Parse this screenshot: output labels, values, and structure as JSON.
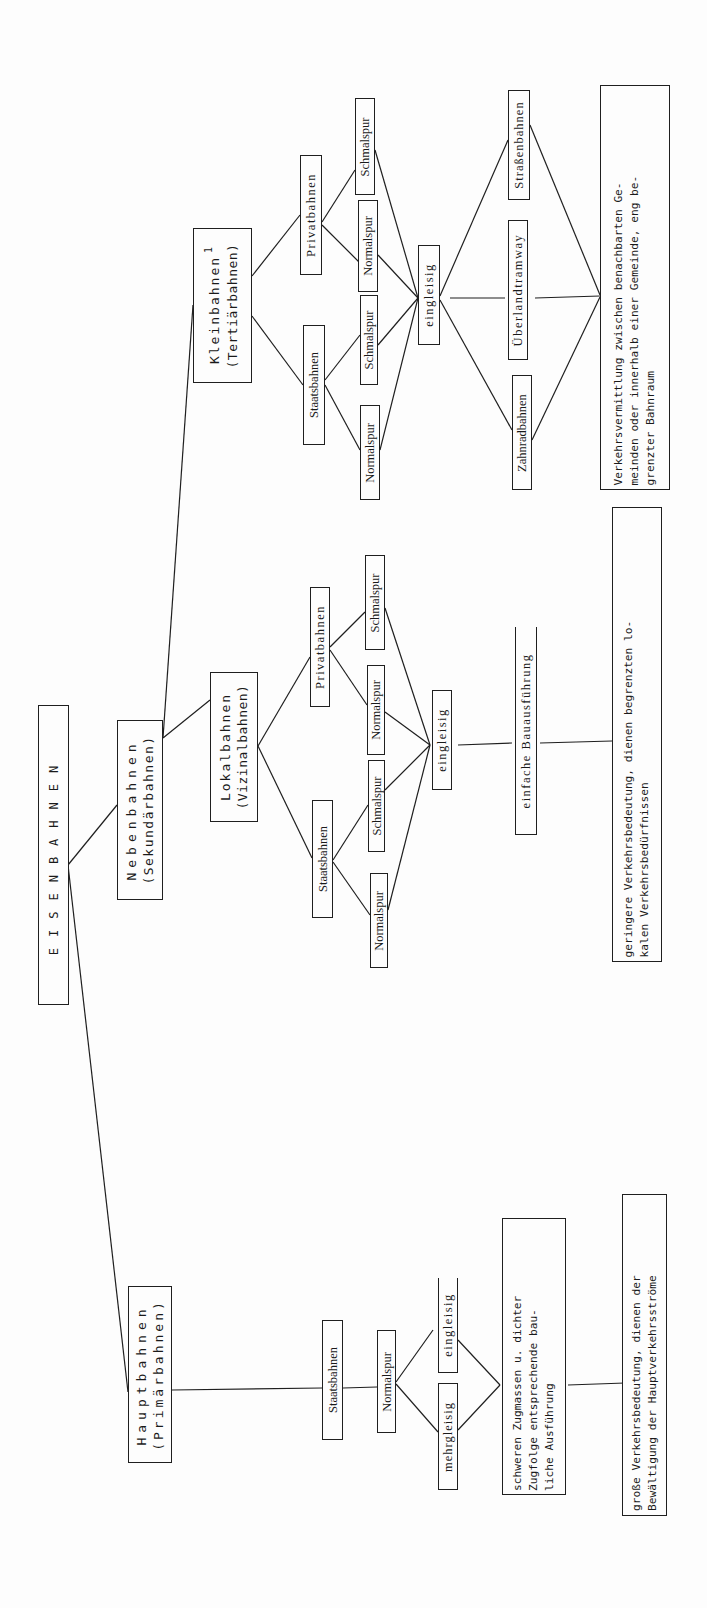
{
  "title": "EISENBAHNEN",
  "categories": {
    "haupt": {
      "name": "Hauptbahnen",
      "alt": "(Primärbahnen)"
    },
    "neben": {
      "name": "Nebenbahnen",
      "alt": "(Sekundärbahnen)"
    },
    "lokal": {
      "name": "Lokalbahnen",
      "alt": "(Vizinalbahnen)"
    },
    "klein": {
      "name": "Kleinbahnen",
      "alt": "(Tertiärbahnen)",
      "footnote": "1"
    }
  },
  "haupt": {
    "operator": "Staatsbahnen",
    "gauge": "Normalspur",
    "tracks": [
      "mehrgleisig",
      "eingleisig"
    ],
    "construction": [
      "schweren Zugmassen u. dichter",
      "Zugfolge entsprechende bau-",
      "liche Ausführung"
    ],
    "description": [
      "große Verkehrsbedeutung, dienen der",
      "Bewältigung der Hauptverkehrsströme"
    ]
  },
  "lokal": {
    "operators": [
      "Staatsbahnen",
      "Privatbahnen"
    ],
    "staats_gauges": [
      "Normalspur",
      "Schmalspur"
    ],
    "privat_gauges": [
      "Normalspur",
      "Schmalspur"
    ],
    "tracks": "eingleisig",
    "construction": "einfache Bauausführung",
    "description": [
      "geringere Verkehrsbedeutung, dienen begrenzten lo-",
      "kalen Verkehrsbedürfnissen"
    ]
  },
  "klein": {
    "operators": [
      "Staatsbahnen",
      "Privatbahnen"
    ],
    "staats_gauges": [
      "Normalspur",
      "Schmalspur"
    ],
    "privat_gauges": [
      "Normalspur",
      "Schmalspur"
    ],
    "tracks": "eingleisig",
    "types": [
      "Zahnradbahnen",
      "Überlandtramway",
      "Straßenbahnen"
    ],
    "description": [
      "Verkehrsvermittlung zwischen benachbarten Ge-",
      "meinden oder innerhalb einer Gemeinde, eng be-",
      "grenzter Bahnraum"
    ]
  },
  "colors": {
    "ink": "#1f1f1f",
    "paper": "#fdfdfd"
  }
}
